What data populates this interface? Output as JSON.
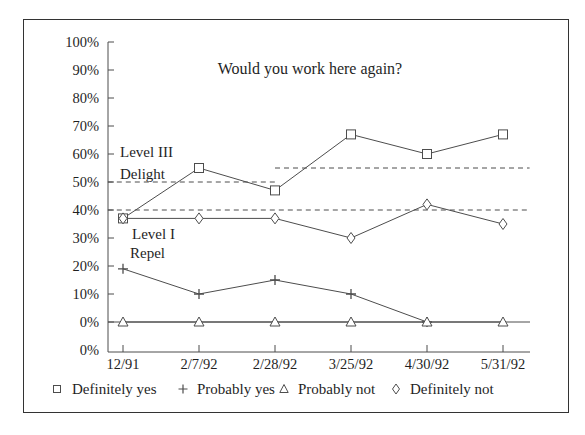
{
  "chart_data": {
    "type": "line",
    "title": "Would you work here again?",
    "categories": [
      "12/91",
      "2/7/92",
      "2/28/92",
      "3/25/92",
      "4/30/92",
      "5/31/92"
    ],
    "y_tick_labels": [
      "100%",
      "90%",
      "80%",
      "70%",
      "60%",
      "50%",
      "40%",
      "30%",
      "20%",
      "10%",
      "0%",
      "0%"
    ],
    "ylabel": "",
    "xlabel": "",
    "ylim": [
      0,
      100
    ],
    "grid": "off",
    "legend_position": "bottom",
    "series": [
      {
        "name": "Definitely yes",
        "marker": "square",
        "values": [
          37,
          55,
          47,
          67,
          60,
          67
        ]
      },
      {
        "name": "Probably yes",
        "marker": "plus",
        "values": [
          19,
          10,
          15,
          10,
          0,
          null
        ]
      },
      {
        "name": "Probably not",
        "marker": "triangle",
        "values": [
          0,
          0,
          0,
          0,
          0,
          0
        ]
      },
      {
        "name": "Definitely not",
        "marker": "diamond",
        "values": [
          37,
          37,
          37,
          30,
          42,
          35
        ]
      }
    ],
    "reference_lines": [
      {
        "label": "Level III Delight (through 2/28/92)",
        "value": 50,
        "start_category": -0.2,
        "end_category": 2.0,
        "style": "dashed"
      },
      {
        "label": "Level III Delight (after 2/28/92)",
        "value": 55,
        "start_category": 2.0,
        "end_category": 5.35,
        "style": "dashed"
      },
      {
        "label": "Level I Repel",
        "value": 40,
        "start_category": -0.2,
        "end_category": 5.35,
        "style": "dashed"
      }
    ],
    "annotations": [
      {
        "lines": [
          "Level III",
          "Delight"
        ]
      },
      {
        "lines": [
          "Level I",
          "Repel"
        ]
      }
    ],
    "colors": {
      "line": "#4d4d4d",
      "text": "#1f1f1f",
      "frame": "#333333",
      "background": "#ffffff"
    }
  }
}
